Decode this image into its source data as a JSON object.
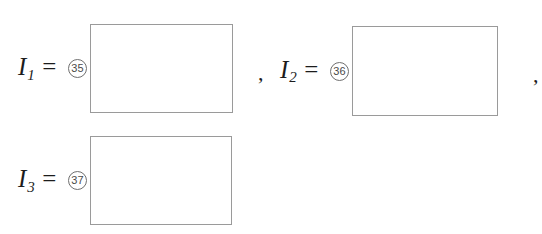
{
  "worksheet": {
    "rows": [
      {
        "variable": "I",
        "subscript": "1",
        "equals": "=",
        "slot_number": "35",
        "answer_value": "",
        "trailing_punctuation": ","
      },
      {
        "variable": "I",
        "subscript": "2",
        "equals": "=",
        "slot_number": "36",
        "answer_value": "",
        "trailing_punctuation": ","
      },
      {
        "variable": "I",
        "subscript": "3",
        "equals": "=",
        "slot_number": "37",
        "answer_value": "",
        "trailing_punctuation": ""
      }
    ],
    "colors": {
      "background": "#ffffff",
      "text": "#1c1c1c",
      "box_border": "#9a9a9a",
      "circle_border": "#6f6f6f",
      "circle_text": "#4a4a4a"
    }
  }
}
